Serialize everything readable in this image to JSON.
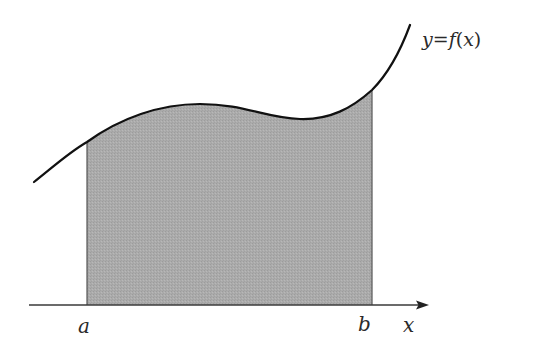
{
  "diagram": {
    "type": "definite-integral-area",
    "curve_label": {
      "y": "y",
      "eq": "=",
      "f": "f",
      "lp": "(",
      "x": "x",
      "rp": ")"
    },
    "lower_bound_label": "a",
    "upper_bound_label": "b",
    "x_axis_label": "x",
    "colors": {
      "curve": "#111111",
      "area_fill": "#a9a9a9",
      "axis": "#3a3a3a",
      "bound_lines": "#555555",
      "background": "#ffffff"
    }
  }
}
